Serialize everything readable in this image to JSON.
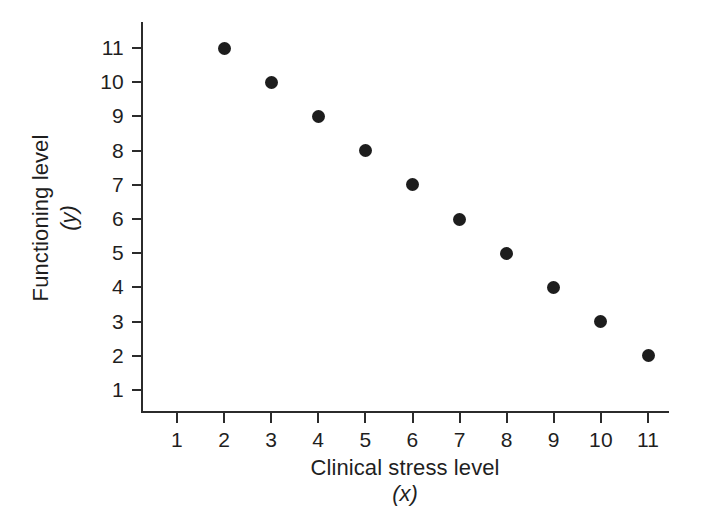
{
  "chart_data": {
    "type": "scatter",
    "title": "",
    "xlabel": "Clinical stress level",
    "xlabel_symbol": "(x)",
    "ylabel": "Functioning level",
    "ylabel_symbol": "(y)",
    "x": [
      2,
      3,
      4,
      5,
      6,
      7,
      8,
      9,
      10,
      11
    ],
    "y": [
      11,
      10,
      9,
      8,
      7,
      6,
      5,
      4,
      3,
      2
    ],
    "points": [
      {
        "x": 2,
        "y": 11
      },
      {
        "x": 3,
        "y": 10
      },
      {
        "x": 4,
        "y": 9
      },
      {
        "x": 5,
        "y": 8
      },
      {
        "x": 6,
        "y": 7
      },
      {
        "x": 7,
        "y": 6
      },
      {
        "x": 8,
        "y": 5
      },
      {
        "x": 9,
        "y": 4
      },
      {
        "x": 10,
        "y": 3
      },
      {
        "x": 11,
        "y": 2
      }
    ],
    "xlim": [
      0.2,
      11.4
    ],
    "ylim": [
      0.35,
      11.5
    ],
    "xticks": [
      1,
      2,
      3,
      4,
      5,
      6,
      7,
      8,
      9,
      10,
      11
    ],
    "yticks": [
      1,
      2,
      3,
      4,
      5,
      6,
      7,
      8,
      9,
      10,
      11
    ],
    "xticklabels": [
      "1",
      "2",
      "3",
      "4",
      "5",
      "6",
      "7",
      "8",
      "9",
      "10",
      "11"
    ],
    "yticklabels": [
      "1",
      "2",
      "3",
      "4",
      "5",
      "6",
      "7",
      "8",
      "9",
      "10",
      "11"
    ],
    "grid": false,
    "legend": null,
    "marker": "filled-circle",
    "marker_color": "#1d1d1d",
    "axis_color": "#2b2b2b",
    "background_color": "#ffffff",
    "relationship": "perfect negative linear"
  },
  "axes": {
    "x_title_main": "Clinical stress level",
    "x_title_sub": "(x)",
    "y_title_main": "Functioning level",
    "y_title_sub": "(y)"
  }
}
